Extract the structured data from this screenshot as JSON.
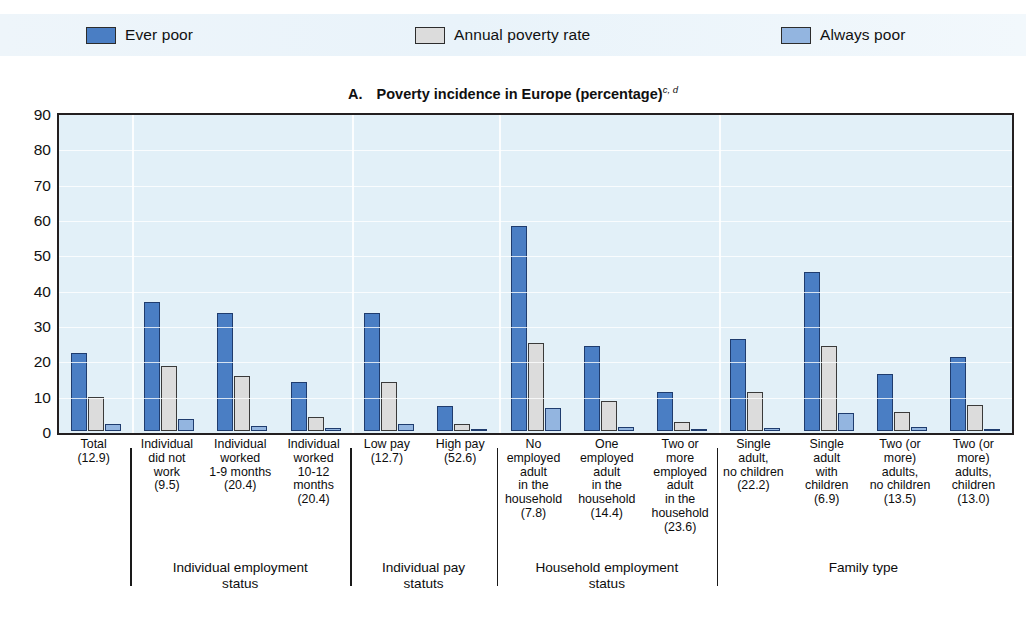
{
  "legend": {
    "items": [
      {
        "label": "Ever poor",
        "color": "#4a7ec4",
        "icon": "square-swatch-icon"
      },
      {
        "label": "Annual poverty rate",
        "color": "#dcdcdc",
        "icon": "square-swatch-icon"
      },
      {
        "label": "Always poor",
        "color": "#93b5e0",
        "icon": "square-swatch-icon"
      }
    ]
  },
  "title": {
    "panel_letter": "A.",
    "text": "Poverty incidence in Europe (percentage)",
    "superscript": "c, d"
  },
  "chart_data": {
    "type": "bar",
    "xlabel": "",
    "ylabel": "",
    "ylim": [
      0,
      90
    ],
    "yticks": [
      0,
      10,
      20,
      30,
      40,
      50,
      60,
      70,
      80,
      90
    ],
    "grid": true,
    "legend_position": "top",
    "categories": [
      "Total\n(12.9)",
      "Individual\ndid not\nwork\n(9.5)",
      "Individual\nworked\n1-9 months\n(20.4)",
      "Individual\nworked\n10-12\nmonths\n(20.4)",
      "Low pay\n(12.7)",
      "High pay\n(52.6)",
      "No\nemployed\nadult\nin the\nhousehold\n(7.8)",
      "One\nemployed\nadult\nin the\nhousehold\n(14.4)",
      "Two or\nmore\nemployed\nadult\nin the\nhousehold\n(23.6)",
      "Single\nadult,\nno children\n(22.2)",
      "Single\nadult\nwith\nchildren\n(6.9)",
      "Two (or\nmore)\nadults,\nno children\n(13.5)",
      "Two (or\nmore)\nadults,\nchildren\n(13.0)"
    ],
    "series": [
      {
        "name": "Ever poor",
        "color": "#4a7ec4",
        "values": [
          22.0,
          36.5,
          33.5,
          14.0,
          33.5,
          7.0,
          58.0,
          24.0,
          11.0,
          26.0,
          45.0,
          16.0,
          21.0
        ]
      },
      {
        "name": "Annual poverty rate",
        "color": "#dcdcdc",
        "values": [
          9.5,
          18.5,
          15.5,
          4.0,
          14.0,
          2.0,
          25.0,
          8.5,
          2.5,
          11.0,
          24.0,
          5.5,
          7.5
        ]
      },
      {
        "name": "Always poor",
        "color": "#93b5e0",
        "values": [
          2.0,
          3.5,
          1.5,
          0.8,
          2.0,
          0.2,
          6.5,
          1.0,
          0.5,
          0.8,
          5.0,
          1.0,
          0.7
        ]
      }
    ]
  },
  "xaxis": {
    "labels": [
      "Total\n(12.9)",
      "Individual\ndid not\nwork\n(9.5)",
      "Individual\nworked\n1-9 months\n(20.4)",
      "Individual\nworked\n10-12\nmonths\n(20.4)",
      "Low pay\n(12.7)",
      "High pay\n(52.6)",
      "No\nemployed\nadult\nin the\nhousehold\n(7.8)",
      "One\nemployed\nadult\nin the\nhousehold\n(14.4)",
      "Two or\nmore\nemployed\nadult\nin the\nhousehold\n(23.6)",
      "Single\nadult,\nno children\n(22.2)",
      "Single\nadult\nwith\nchildren\n(6.9)",
      "Two (or\nmore)\nadults,\nno children\n(13.5)",
      "Two (or\nmore)\nadults,\nchildren\n(13.0)"
    ]
  },
  "groups": [
    {
      "label": "",
      "first": 0,
      "last": 0
    },
    {
      "label": "Individual employment\nstatus",
      "first": 1,
      "last": 3
    },
    {
      "label": "Individual pay\nstatuts",
      "first": 4,
      "last": 5
    },
    {
      "label": "Household employment\nstatus",
      "first": 6,
      "last": 8
    },
    {
      "label": "Family type",
      "first": 9,
      "last": 12
    }
  ]
}
